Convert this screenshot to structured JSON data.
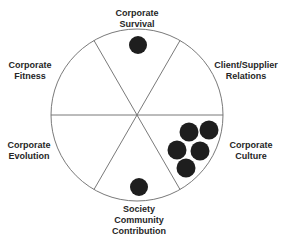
{
  "diagram": {
    "type": "circle-sector-diagram",
    "center": [
      137,
      115
    ],
    "radius": 86,
    "divider_angles_deg": [
      0,
      60,
      120
    ],
    "colors": {
      "outline": "#6a6a6a",
      "dot": "#1e1e1e",
      "text": "#262626",
      "background": "#ffffff"
    },
    "sectors": [
      {
        "id": "corporate-survival",
        "lines": [
          "Corporate",
          "Survival"
        ],
        "label_pos": [
          137,
          8
        ],
        "dot_count": 1
      },
      {
        "id": "client-supplier-relations",
        "lines": [
          "Client/Supplier",
          "Relations"
        ],
        "label_pos": [
          246,
          60
        ],
        "dot_count": 0
      },
      {
        "id": "corporate-culture",
        "lines": [
          "Corporate",
          "Culture"
        ],
        "label_pos": [
          251,
          140
        ],
        "dot_count": 5
      },
      {
        "id": "society-community-contribution",
        "lines": [
          "Society",
          "Community",
          "Contribution"
        ],
        "label_pos": [
          139,
          204
        ],
        "dot_count": 1
      },
      {
        "id": "corporate-evolution",
        "lines": [
          "Corporate",
          "Evolution"
        ],
        "label_pos": [
          29,
          140
        ],
        "dot_count": 0
      },
      {
        "id": "corporate-fitness",
        "lines": [
          "Corporate",
          "Fitness"
        ],
        "label_pos": [
          30,
          60
        ],
        "dot_count": 0
      }
    ],
    "dots": [
      {
        "sector": "corporate-survival",
        "cx": 138,
        "cy": 45,
        "r": 9
      },
      {
        "sector": "corporate-culture",
        "cx": 189,
        "cy": 132,
        "r": 9.5
      },
      {
        "sector": "corporate-culture",
        "cx": 209,
        "cy": 130,
        "r": 9.5
      },
      {
        "sector": "corporate-culture",
        "cx": 177,
        "cy": 150,
        "r": 9.5
      },
      {
        "sector": "corporate-culture",
        "cx": 200,
        "cy": 151,
        "r": 9.5
      },
      {
        "sector": "corporate-culture",
        "cx": 186,
        "cy": 168,
        "r": 9.5
      },
      {
        "sector": "society-community-contribution",
        "cx": 139,
        "cy": 187,
        "r": 9
      }
    ]
  }
}
